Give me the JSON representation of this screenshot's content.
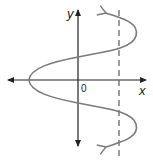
{
  "diagram": {
    "type": "sideways sinusoid with vertical line test",
    "axes": {
      "x_label": "x",
      "y_label": "y",
      "origin_label": "0",
      "axis_color": "#222222"
    },
    "curve": {
      "description": "Sideways wave x = f(y), leftmost vertex on x-axis, opening right with arrows continuing up-left and down-left",
      "color": "#7a7a7a"
    },
    "dashed_line": {
      "description": "Vertical dashed line intersecting curve multiple times",
      "color": "#666666"
    }
  }
}
